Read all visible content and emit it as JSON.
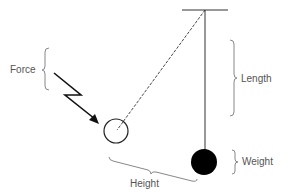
{
  "diagram": {
    "labels": {
      "force": "Force",
      "length": "Length",
      "weight": "Weight",
      "height": "Height"
    },
    "colors": {
      "line": "#222222",
      "brace": "#888888",
      "text": "#555555",
      "weight_fill": "#000000"
    }
  }
}
